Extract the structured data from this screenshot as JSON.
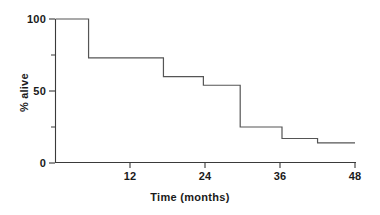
{
  "chart_data": {
    "type": "line",
    "subtype": "step",
    "title": "",
    "subtitle": "",
    "xlabel": "Time (months)",
    "ylabel": "% alive",
    "xlim": [
      0,
      48
    ],
    "ylim": [
      0,
      100
    ],
    "grid": false,
    "legend": null,
    "legend_position": "none",
    "x_ticks": [
      12,
      24,
      36,
      48
    ],
    "x_tick_labels": [
      "12",
      "24",
      "36",
      "48"
    ],
    "x_minor_ticks": [],
    "y_ticks": [
      0,
      50,
      100
    ],
    "y_tick_labels": [
      "0",
      "50",
      "100"
    ],
    "y_minor_ticks": [
      25,
      75
    ],
    "series": [
      {
        "name": "Survival",
        "color": "#555555",
        "step": "post",
        "x": [
          0,
          5.3,
          17.3,
          23.7,
          29.6,
          36.3,
          42.0,
          48.0
        ],
        "y": [
          100,
          73,
          60,
          54,
          25,
          17,
          14,
          14
        ],
        "points": [
          {
            "time": 0,
            "percent_alive": 100
          },
          {
            "time": 5.3,
            "percent_alive": 73
          },
          {
            "time": 17.3,
            "percent_alive": 60
          },
          {
            "time": 23.7,
            "percent_alive": 54
          },
          {
            "time": 29.6,
            "percent_alive": 25
          },
          {
            "time": 36.3,
            "percent_alive": 17
          },
          {
            "time": 42.0,
            "percent_alive": 14
          },
          {
            "time": 48.0,
            "percent_alive": 14
          }
        ]
      }
    ],
    "annotations": []
  },
  "style": {
    "axis_color": "#3a3a3a",
    "curve_color": "#555555",
    "text_color": "#1a1a1a",
    "background": "#ffffff"
  }
}
